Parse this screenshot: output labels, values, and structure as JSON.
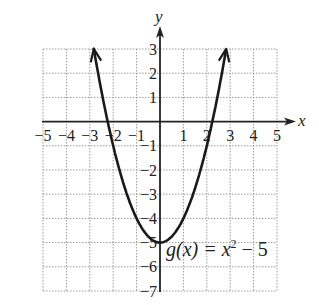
{
  "chart_data": {
    "type": "line",
    "title": "",
    "function_label": "g(x) = x² − 5",
    "function_label_parts": {
      "name": "g(x) = x",
      "exponent": "2",
      "rest": " − 5"
    },
    "xlabel": "x",
    "ylabel": "y",
    "xlim": [
      -5,
      5
    ],
    "ylim": [
      -7,
      3
    ],
    "grid": true,
    "x_ticks": [
      -5,
      -4,
      -3,
      -2,
      -1,
      1,
      2,
      3,
      4,
      5
    ],
    "y_ticks": [
      3,
      2,
      1,
      -1,
      -2,
      -3,
      -4,
      -5,
      -6,
      -7
    ],
    "x_tick_labels": [
      "−5",
      "−4",
      "−3",
      "−2",
      "−1",
      "1",
      "2",
      "3",
      "4",
      "5"
    ],
    "y_tick_labels": [
      "3",
      "2",
      "1",
      "−1",
      "−2",
      "−3",
      "−4",
      "−5",
      "−6",
      "−7"
    ],
    "series": [
      {
        "name": "g(x) = x^2 - 5",
        "x": [
          -2.83,
          -2.5,
          -2,
          -1.5,
          -1,
          -0.5,
          0,
          0.5,
          1,
          1.5,
          2,
          2.5,
          2.83
        ],
        "y": [
          3,
          1.25,
          -1,
          -2.75,
          -4,
          -4.75,
          -5,
          -4.75,
          -4,
          -2.75,
          -1,
          1.25,
          3
        ],
        "arrows": "both-ends"
      }
    ],
    "vertex": [
      0,
      -5
    ],
    "colors": {
      "curve": "#1a1a1a",
      "axes": "#222222",
      "grid": "#9a9a9a"
    }
  }
}
